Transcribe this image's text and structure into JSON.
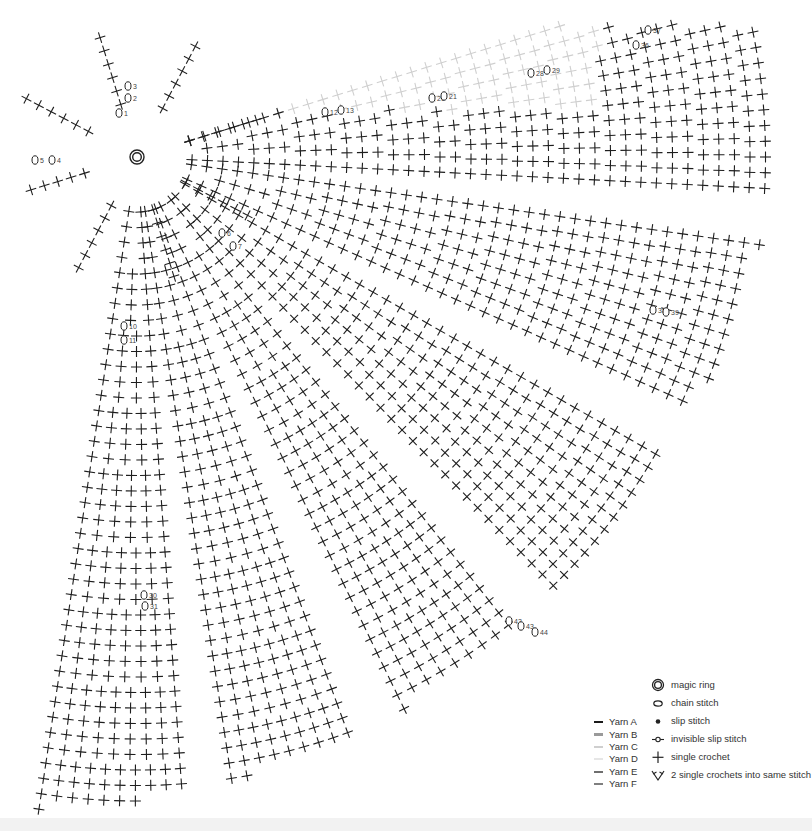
{
  "diagram": {
    "type": "crochet-stitch-chart",
    "center": {
      "x": 137,
      "y": 157,
      "symbol": "magic-ring"
    },
    "stitch_color": "#1e1e1e",
    "light_stitch_color": "#cfcfcf",
    "markers": [
      {
        "n": "1",
        "x": 119,
        "y": 113
      },
      {
        "n": "2",
        "x": 128,
        "y": 98
      },
      {
        "n": "3",
        "x": 128,
        "y": 86
      },
      {
        "n": "4",
        "x": 52,
        "y": 160
      },
      {
        "n": "5",
        "x": 35,
        "y": 160
      },
      {
        "n": "6",
        "x": 222,
        "y": 233
      },
      {
        "n": "7",
        "x": 233,
        "y": 246
      },
      {
        "n": "10",
        "x": 124,
        "y": 326
      },
      {
        "n": "11",
        "x": 124,
        "y": 340
      },
      {
        "n": "12",
        "x": 325,
        "y": 112
      },
      {
        "n": "13",
        "x": 341,
        "y": 110
      },
      {
        "n": "20",
        "x": 432,
        "y": 98
      },
      {
        "n": "21",
        "x": 444,
        "y": 96
      },
      {
        "n": "28",
        "x": 531,
        "y": 73
      },
      {
        "n": "29",
        "x": 547,
        "y": 70
      },
      {
        "n": "30",
        "x": 144,
        "y": 595
      },
      {
        "n": "31",
        "x": 145,
        "y": 606
      },
      {
        "n": "36",
        "x": 636,
        "y": 45
      },
      {
        "n": "37",
        "x": 648,
        "y": 30
      },
      {
        "n": "38",
        "x": 653,
        "y": 310
      },
      {
        "n": "39",
        "x": 666,
        "y": 312
      },
      {
        "n": "42",
        "x": 509,
        "y": 621
      },
      {
        "n": "43",
        "x": 521,
        "y": 626
      },
      {
        "n": "44",
        "x": 535,
        "y": 632
      }
    ]
  },
  "legend": {
    "yarns": [
      {
        "label": "Yarn A",
        "color": "#1a1a1a"
      },
      {
        "label": "Yarn B",
        "color": "#9a9a9a"
      },
      {
        "label": "Yarn C",
        "color": "#cfcfcf"
      },
      {
        "label": "Yarn D",
        "color": "#e6e6e6"
      },
      {
        "label": "Yarn E",
        "color": "#6e6e6e"
      },
      {
        "label": "Yarn F",
        "color": "#7f7f7f"
      }
    ],
    "symbols": [
      {
        "icon": "magic-ring-icon",
        "label": "magic ring"
      },
      {
        "icon": "chain-stitch-icon",
        "label": "chain stitch"
      },
      {
        "icon": "slip-stitch-icon",
        "label": "slip stitch"
      },
      {
        "icon": "invisible-slip-stitch-icon",
        "label": "invisible slip stitch"
      },
      {
        "icon": "single-crochet-icon",
        "label": "single crochet"
      },
      {
        "icon": "increase-icon",
        "label": "2 single crochets into same stitch"
      }
    ]
  }
}
